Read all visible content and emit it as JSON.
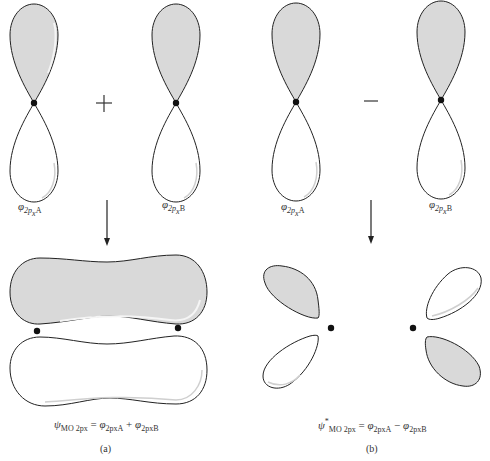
{
  "colors": {
    "shaded_lobe": "#d9d9d9",
    "outline": "#222222",
    "nucleus": "#111111",
    "background": "#ffffff"
  },
  "panel_a": {
    "orbital_left_label": {
      "sym": "φ",
      "sub": "2p",
      "subsub": "x",
      "atom": "A"
    },
    "operator": "+",
    "orbital_right_label": {
      "sym": "φ",
      "sub": "2p",
      "subsub": "x",
      "atom": "B"
    },
    "result_equation": {
      "lhs": "ψ",
      "lhs_sub": "MO 2px",
      "eq": "=",
      "t1": "φ",
      "t1_sub": "2pxA",
      "op": "+",
      "t2": "φ",
      "t2_sub": "2pxB"
    },
    "caption": "(a)"
  },
  "panel_b": {
    "orbital_left_label": {
      "sym": "φ",
      "sub": "2p",
      "subsub": "x",
      "atom": "A"
    },
    "operator": "−",
    "orbital_right_label": {
      "sym": "φ",
      "sub": "2p",
      "subsub": "x",
      "atom": "B"
    },
    "result_equation": {
      "lhs": "ψ",
      "lhs_star": "*",
      "lhs_sub": "MO 2px",
      "eq": "=",
      "t1": "φ",
      "t1_sub": "2pxA",
      "op": "−",
      "t2": "φ",
      "t2_sub": "2pxB"
    },
    "caption": "(b)"
  }
}
